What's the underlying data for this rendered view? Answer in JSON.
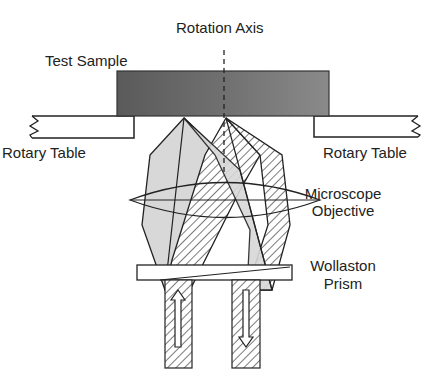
{
  "labels": {
    "rotation_axis": "Rotation Axis",
    "test_sample": "Test Sample",
    "rotary_table_left": "Rotary Table",
    "rotary_table_right": "Rotary Table",
    "objective_line1": "Microscope",
    "objective_line2": "Objective",
    "prism_line1": "Wollaston",
    "prism_line2": "Prism"
  },
  "colors": {
    "line": "#222222",
    "sample_fill": "#6a6a6a",
    "beam_gray": "#d4d4d4"
  }
}
